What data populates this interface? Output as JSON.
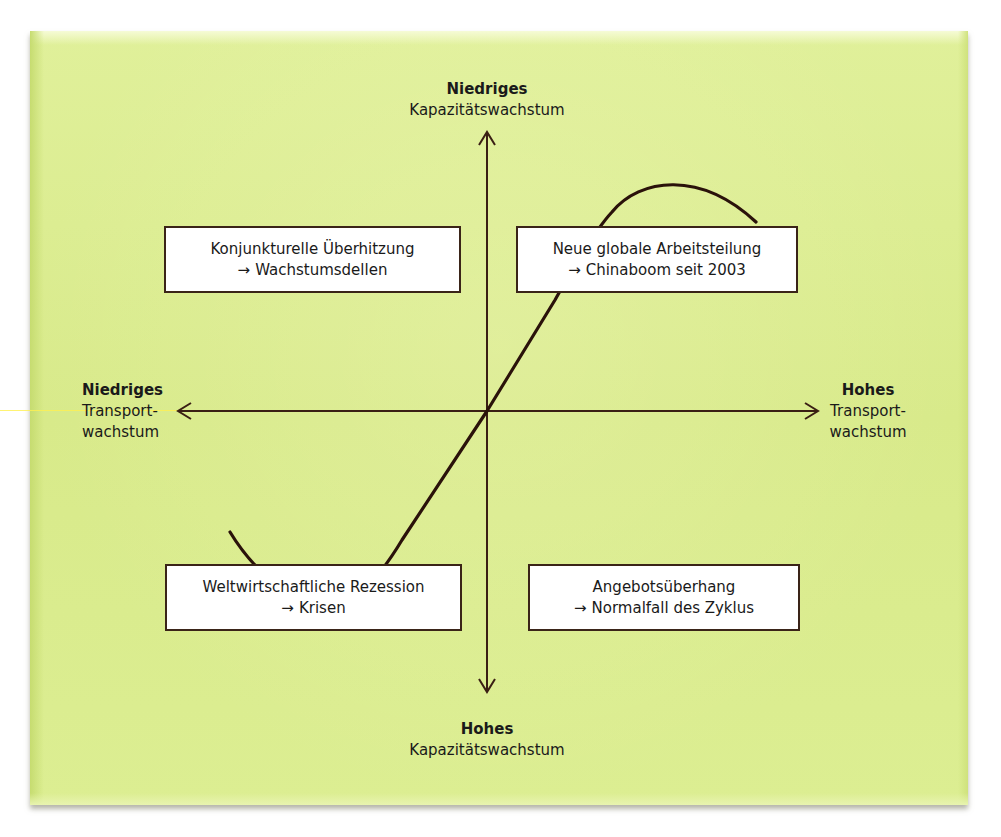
{
  "diagram": {
    "type": "quadrant",
    "background_color": "#dbec8e",
    "axis_color": "#3a1f14",
    "axes": {
      "vertical": {
        "top": {
          "bold": "Niedriges",
          "text": "Kapazitätswachstum"
        },
        "bottom": {
          "bold": "Hohes",
          "text": "Kapazitätswachstum"
        }
      },
      "horizontal": {
        "left": {
          "bold": "Niedriges",
          "line1": "Transport-",
          "line2": "wachstum"
        },
        "right": {
          "bold": "Hohes",
          "line1": "Transport-",
          "line2": "wachstum"
        }
      }
    },
    "quadrants": {
      "top_left": {
        "line1": "Konjunkturelle Überhitzung",
        "arrow": "→",
        "line2": "Wachstumsdellen"
      },
      "top_right": {
        "line1": "Neue globale Arbeitsteilung",
        "arrow": "→",
        "line2": "Chinaboom seit 2003"
      },
      "bottom_left": {
        "line1": "Weltwirtschaftliche Rezession",
        "arrow": "→",
        "line2": "Krisen"
      },
      "bottom_right": {
        "line1": "Angebotsüberhang",
        "arrow": "→",
        "line2": "Normalfall des Zyklus"
      }
    },
    "curve": {
      "description": "S-shaped cycle curve from lower-left through origin to upper-right"
    }
  },
  "top_clipped_text": "y g g g g"
}
